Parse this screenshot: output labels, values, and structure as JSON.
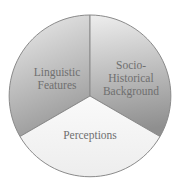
{
  "diagram": {
    "type": "three-segment circle",
    "segments": [
      {
        "id": "linguistic",
        "lines": [
          "Linguistic",
          "Features"
        ]
      },
      {
        "id": "socio",
        "lines": [
          "Socio-",
          "Historical",
          "Background"
        ]
      },
      {
        "id": "perceptions",
        "lines": [
          "Perceptions"
        ]
      }
    ],
    "colors": {
      "outline": "#8a8a8a",
      "top_light": "#ececec",
      "top_dark": "#9a9a9a",
      "bottom_fill": "#f2f2f2",
      "text": "#6f6f6f"
    }
  }
}
